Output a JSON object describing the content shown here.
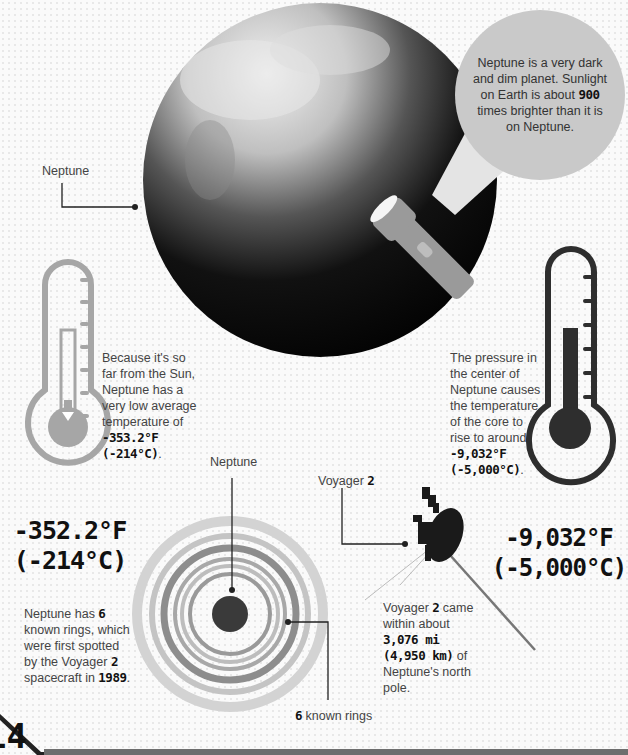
{
  "planet_label": "Neptune",
  "callout": {
    "text_before": "Neptune is a very dark and dim planet. Sunlight on Earth is about ",
    "highlight": "900",
    "text_after": " times brighter than it is on Neptune."
  },
  "left_thermometer": {
    "desc_before": "Because it's so far from the Sun, Neptune has a very low average temperature of ",
    "desc_highlight": "-353.2°F (-214°C)",
    "desc_after": ".",
    "big_f": "-352.2°F",
    "big_c": "(-214°C)",
    "color": "#a6a6a6"
  },
  "right_thermometer": {
    "desc_before": "The pressure in the center of Neptune causes the temperature of the core to rise to around ",
    "desc_highlight": "-9,032°F (-5,000°C)",
    "desc_after": ".",
    "big_f": "-9,032°F",
    "big_c": "(-5,000°C)",
    "color": "#2e2e2e"
  },
  "rings": {
    "planet_label": "Neptune",
    "count_bold": "6",
    "count_label": " known rings",
    "desc_1": "Neptune has ",
    "desc_count": "6",
    "desc_2": " known rings, which were first spotted by the Voyager ",
    "desc_voyager_num": "2",
    "desc_3": " spacecraft in ",
    "desc_year": "1989",
    "desc_4": "."
  },
  "voyager": {
    "label": "Voyager ",
    "label_num": "2",
    "desc_1": "Voyager ",
    "desc_num": "2",
    "desc_2": " came within about ",
    "desc_dist": "3,076 mi (4,950 km)",
    "desc_3": " of Neptune's north pole."
  },
  "page_number": "14",
  "colors": {
    "light_gray": "#c9c9c9",
    "mid_gray": "#a6a6a6",
    "dark": "#2e2e2e",
    "footer_bar": "#6e6e6e"
  }
}
